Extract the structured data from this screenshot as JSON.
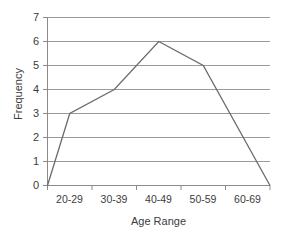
{
  "chart_data": {
    "type": "line",
    "title": "",
    "subtitle": "",
    "xlabel": "Age Range",
    "ylabel": "Frequency",
    "categories": [
      "20-29",
      "30-39",
      "40-49",
      "50-59",
      "60-69"
    ],
    "values": [
      3,
      4,
      6,
      5,
      0
    ],
    "series": [
      {
        "name": "Frequency",
        "values": [
          3,
          4,
          6,
          5,
          0
        ]
      }
    ],
    "polygon_closure": {
      "left_anchor_value": 0,
      "right_anchor_value": 0,
      "note": "frequency polygon: line begins at 0 on the y-axis and returns to 0 at the right plot edge"
    },
    "y_ticks": [
      0,
      1,
      2,
      3,
      4,
      5,
      6,
      7
    ],
    "ylim": [
      0,
      7
    ],
    "grid": "horizontal",
    "legend": "none",
    "colors": {
      "line": "#6b6b6b",
      "gridline": "#9a9a9a",
      "axis": "#8c8c8c",
      "text": "#3c3c3c",
      "background": "#ffffff"
    }
  },
  "axes": {
    "y_tick_labels": [
      "7",
      "6",
      "5",
      "4",
      "3",
      "2",
      "1",
      "0"
    ],
    "x_tick_labels": [
      "20-29",
      "30-39",
      "40-49",
      "50-59",
      "60-69"
    ],
    "y_title": "Frequency",
    "x_title": "Age Range"
  }
}
